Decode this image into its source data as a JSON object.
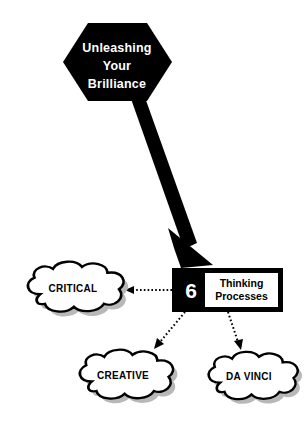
{
  "diagram": {
    "title_node": {
      "shape": "hexagon",
      "lines": [
        "Unleashing",
        "Your",
        "Brilliance"
      ],
      "fill": "#000000",
      "text_color": "#ffffff"
    },
    "main_arrow": {
      "name": "thick-black-arrow",
      "direction": "down-right",
      "color": "#000000"
    },
    "process_box": {
      "number": "6",
      "label_lines": [
        "Thinking",
        "Processes"
      ],
      "fill": "#000000",
      "inner_fill": "#ffffff",
      "number_color": "#ffffff",
      "label_color": "#000000"
    },
    "clouds": [
      {
        "id": "critical",
        "label": "CRITICAL"
      },
      {
        "id": "creative",
        "label": "CREATIVE"
      },
      {
        "id": "davinci",
        "label": "DA VINCI"
      }
    ],
    "connectors": [
      {
        "id": "to-critical",
        "style": "dotted",
        "direction": "left"
      },
      {
        "id": "to-creative",
        "style": "dotted",
        "direction": "down-left"
      },
      {
        "id": "to-davinci",
        "style": "dotted",
        "direction": "down-right"
      }
    ],
    "colors": {
      "background": "#ffffff",
      "ink": "#000000",
      "shadow": "#b0b0b0",
      "outline": "#000000"
    }
  }
}
